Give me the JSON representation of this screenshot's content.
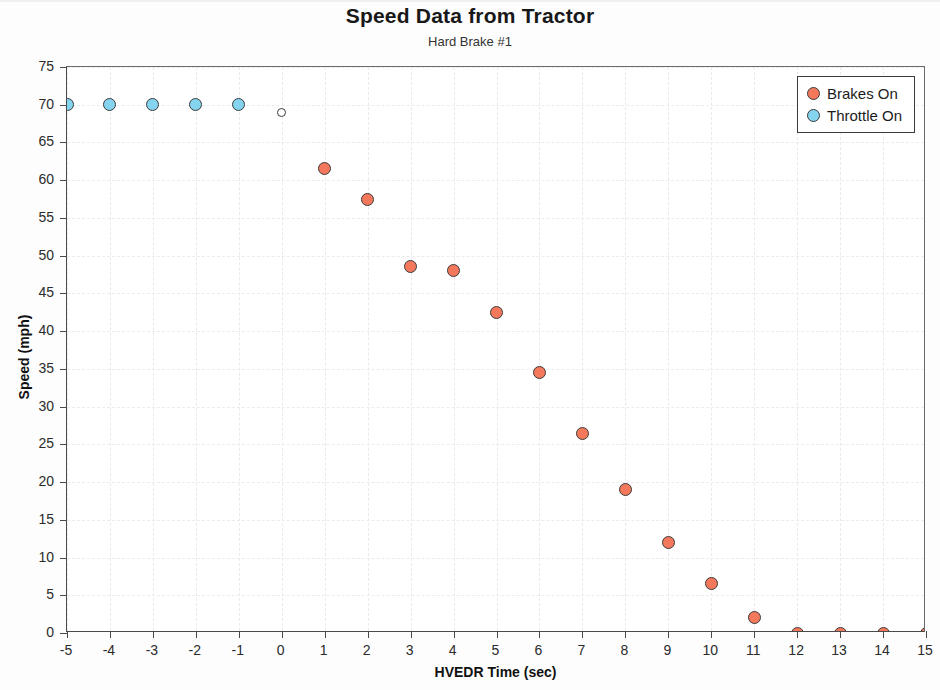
{
  "chart_data": {
    "type": "scatter",
    "title": "Speed Data from Tractor",
    "subtitle": "Hard Brake #1",
    "xlabel": "HVEDR Time (sec)",
    "ylabel": "Speed  (mph)",
    "xlim": [
      -5,
      15
    ],
    "ylim": [
      0,
      75
    ],
    "xticks": [
      -5,
      -4,
      -3,
      -2,
      -1,
      0,
      1,
      2,
      3,
      4,
      5,
      6,
      7,
      8,
      9,
      10,
      11,
      12,
      13,
      14,
      15
    ],
    "yticks": [
      0,
      5,
      10,
      15,
      20,
      25,
      30,
      35,
      40,
      45,
      50,
      55,
      60,
      65,
      70,
      75
    ],
    "xtick_labels": [
      "-5",
      "-4",
      "-3",
      "-2",
      "-1",
      "0",
      "1",
      "2",
      "3",
      "4",
      "5",
      "6",
      "7",
      "8",
      "9",
      "10",
      "11",
      "12",
      "13",
      "14",
      "15"
    ],
    "ytick_labels": [
      "0",
      "5",
      "10",
      "15",
      "20",
      "25",
      "30",
      "35",
      "40",
      "45",
      "50",
      "55",
      "60",
      "65",
      "70",
      "75"
    ],
    "grid": true,
    "legend_position": "top-right",
    "x": [
      -5,
      -4,
      -3,
      -2,
      -1,
      0,
      1,
      2,
      3,
      4,
      5,
      6,
      7,
      8,
      9,
      10,
      11,
      12,
      13,
      14,
      15
    ],
    "values": [
      70,
      70,
      70,
      70,
      70,
      69,
      61.5,
      57.5,
      48.5,
      48,
      42.5,
      34.5,
      26.5,
      19,
      12,
      6.5,
      2,
      0,
      0,
      0,
      0
    ],
    "point_states": [
      "throttle",
      "throttle",
      "throttle",
      "throttle",
      "throttle",
      "none",
      "brakes",
      "brakes",
      "brakes",
      "brakes",
      "brakes",
      "brakes",
      "brakes",
      "brakes",
      "brakes",
      "brakes",
      "brakes",
      "brakes",
      "brakes",
      "brakes",
      "brakes"
    ],
    "series": [
      {
        "name": "Brakes On",
        "color": "#f4785c",
        "x": [
          1,
          2,
          3,
          4,
          5,
          6,
          7,
          8,
          9,
          10,
          11,
          12,
          13,
          14,
          15
        ],
        "values": [
          61.5,
          57.5,
          48.5,
          48,
          42.5,
          34.5,
          26.5,
          19,
          12,
          6.5,
          2,
          0,
          0,
          0,
          0
        ]
      },
      {
        "name": "Throttle On",
        "color": "#84d3ef",
        "x": [
          -5,
          -4,
          -3,
          -2,
          -1
        ],
        "values": [
          70,
          70,
          70,
          70,
          70
        ]
      },
      {
        "name": "No Input",
        "color": "#ffffff",
        "x": [
          0
        ],
        "values": [
          69
        ]
      }
    ]
  },
  "legend": {
    "items": [
      {
        "label": "Brakes On",
        "state": "brakes"
      },
      {
        "label": "Throttle On",
        "state": "throttle"
      }
    ]
  }
}
